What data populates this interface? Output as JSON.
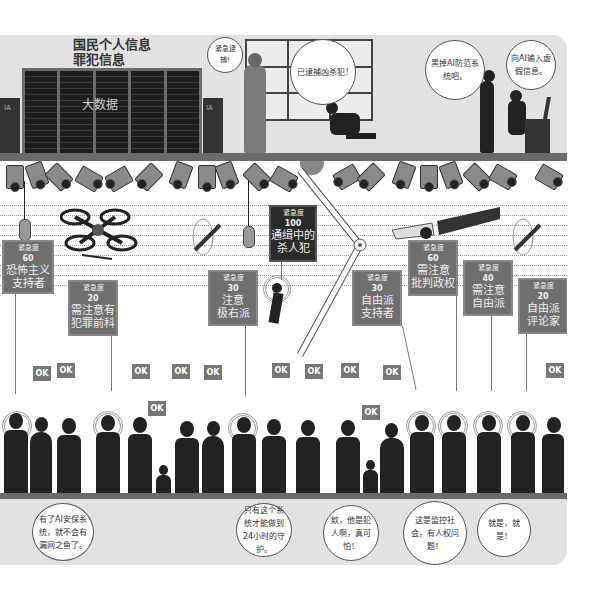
{
  "top_section": {
    "database_title_line1": "国民个人信息",
    "database_title_line2": "罪犯信息",
    "server_label": "大数据",
    "door_labels": [
      "IA",
      "IA"
    ],
    "bubbles": [
      {
        "id": "urgent-arrest",
        "text": "紧急逮捕!"
      },
      {
        "id": "captured",
        "text": "已逮捕凶杀犯!"
      },
      {
        "id": "disable-ai",
        "text": "黑掉AI防范系统吧。"
      },
      {
        "id": "fake-info",
        "text": "向AI输入虚假信息。"
      }
    ]
  },
  "tags": [
    {
      "label": "紧急度",
      "level": "60",
      "line1": "恐怖主义",
      "line2": "支持者",
      "style": "gray"
    },
    {
      "label": "紧急度",
      "level": "20",
      "line1": "需注意有",
      "line2": "犯罪前科",
      "style": "gray"
    },
    {
      "label": "紧急度",
      "level": "30",
      "line1": "注意",
      "line2": "极右派",
      "style": "gray"
    },
    {
      "label": "紧急度",
      "level": "100",
      "line1": "通缉中的",
      "line2": "杀人犯",
      "style": "dark"
    },
    {
      "label": "紧急度",
      "level": "30",
      "line1": "自由派",
      "line2": "支持者",
      "style": "gray"
    },
    {
      "label": "紧急度",
      "level": "60",
      "line1": "需注意",
      "line2": "批判政权",
      "style": "gray"
    },
    {
      "label": "紧急度",
      "level": "40",
      "line1": "需注意",
      "line2": "自由派",
      "style": "gray"
    },
    {
      "label": "紧急度",
      "level": "20",
      "line1": "自由派",
      "line2": "评论家",
      "style": "gray"
    }
  ],
  "ok_label": "OK",
  "ok_badges_count": 13,
  "bottom_bubbles": [
    {
      "text": "有了AI安保系统，就不会有漏网之鱼了。"
    },
    {
      "text": "只有这个系统才能做到24小时的守护。"
    },
    {
      "text": "欸，他是犯人啊，真可怕！"
    },
    {
      "text": "这是监控社会，有人权问题！"
    },
    {
      "text": "就是，就是！"
    }
  ],
  "colors": {
    "tag_gray": "#6f6f6f",
    "tag_dark": "#2a2a2a",
    "silhouette": "#222222",
    "rail": "#6a6a6a",
    "background_stripes": "#e2e2e2"
  }
}
